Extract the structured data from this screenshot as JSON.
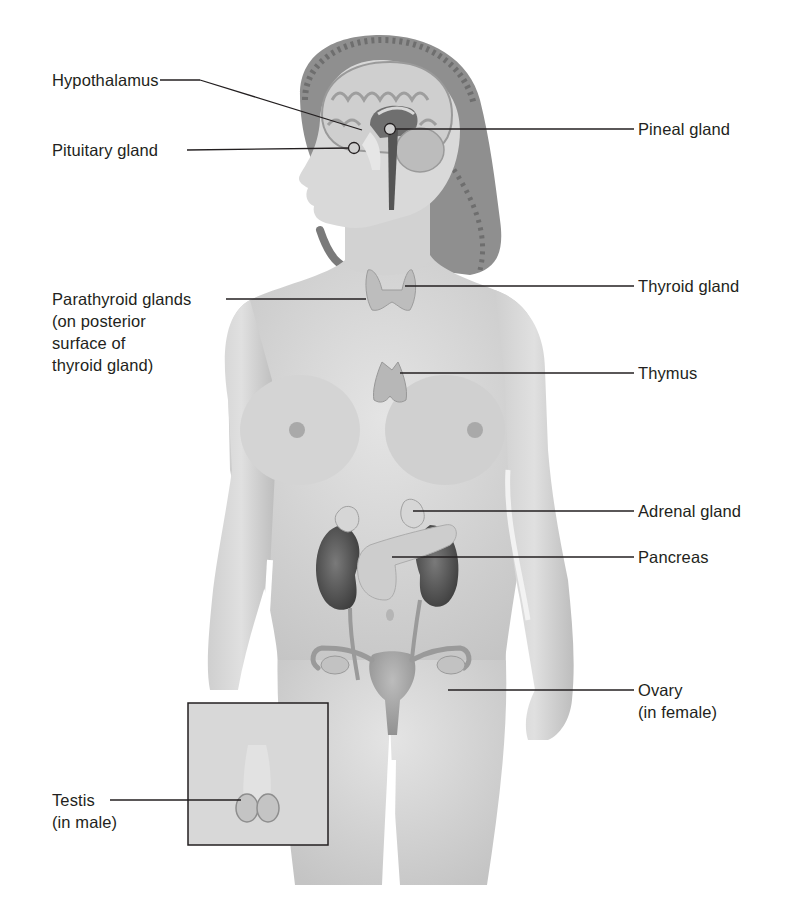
{
  "figure": {
    "colors": {
      "background": "#ffffff",
      "skin": "#d9d9d9",
      "skin_shadow": "#b8b8b8",
      "hair": "#8c8c8c",
      "brain": "#c9c9c9",
      "gland": "#bdbdbd",
      "kidney": "#5a5a5a",
      "leader_line": "#231f20",
      "text": "#231f20"
    }
  },
  "labels": {
    "hypothalamus": "Hypothalamus",
    "pituitary": "Pituitary gland",
    "pineal": "Pineal gland",
    "thyroid": "Thyroid gland",
    "parathyroid": {
      "line1": "Parathyroid glands",
      "line2": "(on posterior",
      "line3": "surface of",
      "line4": "thyroid gland)"
    },
    "thymus": "Thymus",
    "adrenal": "Adrenal gland",
    "pancreas": "Pancreas",
    "ovary": {
      "line1": "Ovary",
      "line2": "(in female)"
    },
    "testis": {
      "line1": "Testis",
      "line2": "(in male)"
    }
  }
}
